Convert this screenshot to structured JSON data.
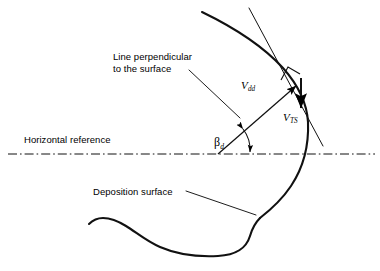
{
  "figure": {
    "background_color": "#ffffff",
    "line_color": "#000000"
  },
  "labels": {
    "perpendicular_line_1": "Line perpendicular",
    "perpendicular_line_2": "to the surface",
    "horizontal_reference": "Horizontal reference",
    "deposition_surface": "Deposition surface"
  },
  "symbols": {
    "v_dd_base": "V",
    "v_dd_sub": "dd",
    "v_ts_base": "V",
    "v_ts_sub": "TS",
    "beta_base": "β",
    "beta_sub": "d"
  },
  "annotations": {
    "right_angle_marker": "right-angle-square",
    "angle_arc": "beta-d-angle-arc",
    "vector_v_dd": "deposition-velocity-vector",
    "vector_v_ts": "terminal-settling-velocity-vector",
    "reference_line_style": "dash-dot"
  }
}
